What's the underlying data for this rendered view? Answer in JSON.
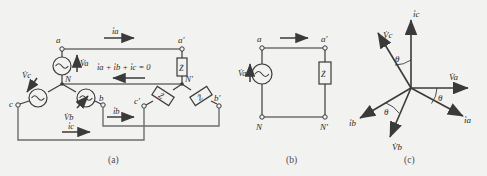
{
  "figure": {
    "background_color": "#f2f2f0",
    "line_color": "#3a3a3a",
    "text_color": "#2b2b2b"
  },
  "panels": [
    {
      "id": "a",
      "caption": "(a)",
      "description": "Three-phase Y-connected source feeding Y-connected load",
      "source_terminals": [
        "a",
        "b",
        "c"
      ],
      "source_neutral": "N",
      "load_terminals": [
        "a'",
        "b'",
        "c'"
      ],
      "load_neutral": "N'",
      "source_labels": [
        "V̇a",
        "V̇b",
        "V̇c"
      ],
      "current_labels": [
        "i̇a",
        "i̇b",
        "i̇c"
      ],
      "impedance_labels": [
        "Ż",
        "Ż",
        "Ż"
      ],
      "kcl_equation": "i̇a + i̇b + i̇c = 0"
    },
    {
      "id": "b",
      "caption": "(b)",
      "description": "Single-phase equivalent circuit",
      "terminals": [
        "a",
        "a'",
        "N",
        "N'"
      ],
      "source_label": "V̇a",
      "impedance_label": "Ż",
      "current_label": ""
    },
    {
      "id": "c",
      "caption": "(c)",
      "description": "Phasor diagram of balanced three-phase voltages and currents",
      "phasors": [
        {
          "name": "V̇a",
          "angle_deg": 0,
          "kind": "voltage"
        },
        {
          "name": "V̇b",
          "angle_deg": -120,
          "kind": "voltage"
        },
        {
          "name": "V̇c",
          "angle_deg": 120,
          "kind": "voltage"
        },
        {
          "name": "i̇a",
          "angle_deg": -30,
          "kind": "current"
        },
        {
          "name": "i̇b",
          "angle_deg": -150,
          "kind": "current"
        },
        {
          "name": "i̇c",
          "angle_deg": 90,
          "kind": "current"
        }
      ],
      "angle_label": "θ",
      "angle_count": 3
    }
  ]
}
